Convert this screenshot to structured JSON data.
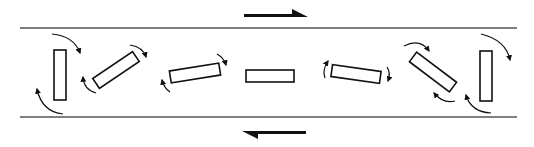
{
  "diagram": {
    "type": "simple-shear-rigid-particle-rotation",
    "colors": {
      "ink": "#111111",
      "line": "#555555",
      "background": "#ffffff"
    },
    "shear_zone": {
      "top_boundary": {
        "x1": 20,
        "x2": 517,
        "y": 28
      },
      "bottom_boundary": {
        "x1": 20,
        "x2": 517,
        "y": 117
      }
    },
    "shear_arrows": [
      {
        "name": "top-shear-arrow",
        "direction": "right",
        "x1": 244,
        "x2": 308,
        "y": 14
      },
      {
        "name": "bottom-shear-arrow",
        "direction": "left",
        "x1": 306,
        "x2": 242,
        "y": 131
      }
    ],
    "particles": [
      {
        "id": 1,
        "cx": 60,
        "cy": 75,
        "w": 12,
        "h": 50,
        "angle": 0
      },
      {
        "id": 2,
        "cx": 116,
        "cy": 70,
        "w": 48,
        "h": 12,
        "angle": -34
      },
      {
        "id": 3,
        "cx": 195,
        "cy": 73,
        "w": 50,
        "h": 12,
        "angle": -9
      },
      {
        "id": 4,
        "cx": 270,
        "cy": 76,
        "w": 48,
        "h": 12,
        "angle": 0
      },
      {
        "id": 5,
        "cx": 356,
        "cy": 74,
        "w": 49,
        "h": 12,
        "angle": 8
      },
      {
        "id": 6,
        "cx": 433,
        "cy": 72,
        "w": 50,
        "h": 12,
        "angle": 37
      },
      {
        "id": 7,
        "cx": 486,
        "cy": 76,
        "w": 12,
        "h": 50,
        "angle": 0
      }
    ],
    "rotation_arrows": [
      {
        "particle": 1,
        "path": "M 52 34 Q 74 36 80 53",
        "head": "end"
      },
      {
        "particle": 1,
        "path": "M 63 114 Q 42 112 37 89",
        "head": "end"
      },
      {
        "particle": 2,
        "path": "M 130 45 Q 143 47 146 57",
        "head": "end"
      },
      {
        "particle": 2,
        "path": "M 96 93 Q 84 90 83 77",
        "head": "end"
      },
      {
        "particle": 3,
        "path": "M 217 54 Q 224 58 226 65",
        "head": "end"
      },
      {
        "particle": 3,
        "path": "M 170 92 Q 164 88 162 80",
        "head": "end"
      },
      {
        "particle": 5,
        "path": "M 325 78 Q 322 70 328 61",
        "head": "end"
      },
      {
        "particle": 5,
        "path": "M 387 67 Q 391 73 388 81",
        "head": "end"
      },
      {
        "particle": 6,
        "path": "M 404 46 Q 420 38 429 51",
        "head": "end"
      },
      {
        "particle": 6,
        "path": "M 455 101 Q 443 104 434 93",
        "head": "end"
      },
      {
        "particle": 7,
        "path": "M 481 34 Q 506 40 510 60",
        "head": "end"
      },
      {
        "particle": 7,
        "path": "M 491 113 Q 471 112 466 95",
        "head": "end"
      }
    ]
  }
}
